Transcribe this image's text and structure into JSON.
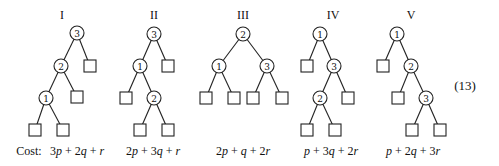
{
  "equation_number": "(13)",
  "cost_prefix": "Cost:",
  "trees": [
    {
      "label": "I",
      "cost": "3p + 2q + r",
      "label_pos": [
        62,
        19
      ],
      "cost_pos": [
        77,
        155
      ],
      "nodes": [
        {
          "key": "3",
          "x": 77,
          "y": 33
        },
        {
          "key": "2",
          "x": 61,
          "y": 66
        },
        {
          "key": "1",
          "x": 46,
          "y": 98
        }
      ],
      "leaves": [
        [
          90,
          66
        ],
        [
          77,
          97
        ],
        [
          35,
          130
        ],
        [
          63,
          130
        ]
      ],
      "edges": [
        [
          77,
          33,
          61,
          66
        ],
        [
          77,
          33,
          90,
          66
        ],
        [
          61,
          66,
          46,
          98
        ],
        [
          61,
          66,
          77,
          97
        ],
        [
          46,
          98,
          35,
          130
        ],
        [
          46,
          98,
          63,
          130
        ]
      ]
    },
    {
      "label": "II",
      "cost": "2p + 3q + r",
      "label_pos": [
        154,
        19
      ],
      "cost_pos": [
        153,
        155
      ],
      "nodes": [
        {
          "key": "3",
          "x": 154,
          "y": 34
        },
        {
          "key": "1",
          "x": 140,
          "y": 66
        },
        {
          "key": "2",
          "x": 154,
          "y": 98
        }
      ],
      "leaves": [
        [
          168,
          66
        ],
        [
          126,
          98
        ],
        [
          140,
          130
        ],
        [
          168,
          130
        ]
      ],
      "edges": [
        [
          154,
          34,
          140,
          66
        ],
        [
          154,
          34,
          168,
          66
        ],
        [
          140,
          66,
          126,
          98
        ],
        [
          140,
          66,
          154,
          98
        ],
        [
          154,
          98,
          140,
          130
        ],
        [
          154,
          98,
          168,
          130
        ]
      ]
    },
    {
      "label": "III",
      "cost": "2p + q + 2r",
      "label_pos": [
        243,
        19
      ],
      "cost_pos": [
        243,
        155
      ],
      "nodes": [
        {
          "key": "2",
          "x": 243,
          "y": 34
        },
        {
          "key": "1",
          "x": 219,
          "y": 66
        },
        {
          "key": "3",
          "x": 267,
          "y": 66
        }
      ],
      "leaves": [
        [
          206,
          98
        ],
        [
          234,
          98
        ],
        [
          253,
          98
        ],
        [
          282,
          98
        ]
      ],
      "edges": [
        [
          243,
          34,
          219,
          66
        ],
        [
          243,
          34,
          267,
          66
        ],
        [
          219,
          66,
          206,
          98
        ],
        [
          219,
          66,
          234,
          98
        ],
        [
          267,
          66,
          253,
          98
        ],
        [
          267,
          66,
          282,
          98
        ]
      ]
    },
    {
      "label": "IV",
      "cost": "p + 3q + 2r",
      "label_pos": [
        333,
        19
      ],
      "cost_pos": [
        331,
        155
      ],
      "nodes": [
        {
          "key": "1",
          "x": 320,
          "y": 34
        },
        {
          "key": "3",
          "x": 334,
          "y": 66
        },
        {
          "key": "2",
          "x": 320,
          "y": 98
        }
      ],
      "leaves": [
        [
          307,
          66
        ],
        [
          348,
          98
        ],
        [
          307,
          130
        ],
        [
          335,
          130
        ]
      ],
      "edges": [
        [
          320,
          34,
          307,
          66
        ],
        [
          320,
          34,
          334,
          66
        ],
        [
          334,
          66,
          320,
          98
        ],
        [
          334,
          66,
          348,
          98
        ],
        [
          320,
          98,
          307,
          130
        ],
        [
          320,
          98,
          335,
          130
        ]
      ]
    },
    {
      "label": "V",
      "cost": "p + 2q + 3r",
      "label_pos": [
        411,
        19
      ],
      "cost_pos": [
        413,
        155
      ],
      "nodes": [
        {
          "key": "1",
          "x": 397,
          "y": 34
        },
        {
          "key": "2",
          "x": 411,
          "y": 66
        },
        {
          "key": "3",
          "x": 426,
          "y": 98
        }
      ],
      "leaves": [
        [
          383,
          66
        ],
        [
          398,
          98
        ],
        [
          412,
          130
        ],
        [
          440,
          130
        ]
      ],
      "edges": [
        [
          397,
          34,
          383,
          66
        ],
        [
          397,
          34,
          411,
          66
        ],
        [
          411,
          66,
          398,
          98
        ],
        [
          411,
          66,
          426,
          98
        ],
        [
          426,
          98,
          412,
          130
        ],
        [
          426,
          98,
          440,
          130
        ]
      ]
    }
  ],
  "colors": {
    "stroke": "#222222",
    "text": "#111111",
    "background": "#ffffff"
  }
}
